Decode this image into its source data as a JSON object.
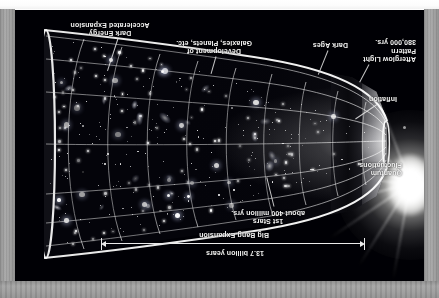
{
  "figure": {
    "orientation": "rotated-180",
    "plate_background": "#000005",
    "frame_color": "#9a9a9a",
    "label_color": "#f2f2f2"
  },
  "scale_bar": {
    "duration_label": "13.7 billion years",
    "process_label": "Big Bang Expansion",
    "arrow_style": "double-headed"
  },
  "labels": {
    "quantum_fluctuations": "Quantum\nFluctuations",
    "inflation": "Inflation",
    "afterglow": "Afterglow Light\nPattern\n380,000 yrs.",
    "dark_ages": "Dark Ages",
    "first_stars": "1st Stars\nabout 400 million yrs.",
    "development": "Development of\nGalaxies, Planets, etc.",
    "dark_energy": "Dark Energy\nAccelerated Expansion"
  },
  "epochs": [
    {
      "name": "Quantum Fluctuations",
      "time": ""
    },
    {
      "name": "Inflation",
      "time": ""
    },
    {
      "name": "Afterglow Light Pattern",
      "time": "380,000 yrs."
    },
    {
      "name": "Dark Ages",
      "time": ""
    },
    {
      "name": "1st Stars",
      "time": "about 400 million yrs."
    },
    {
      "name": "Development of Galaxies, Planets, etc.",
      "time": ""
    },
    {
      "name": "Dark Energy Accelerated Expansion",
      "time": ""
    }
  ]
}
